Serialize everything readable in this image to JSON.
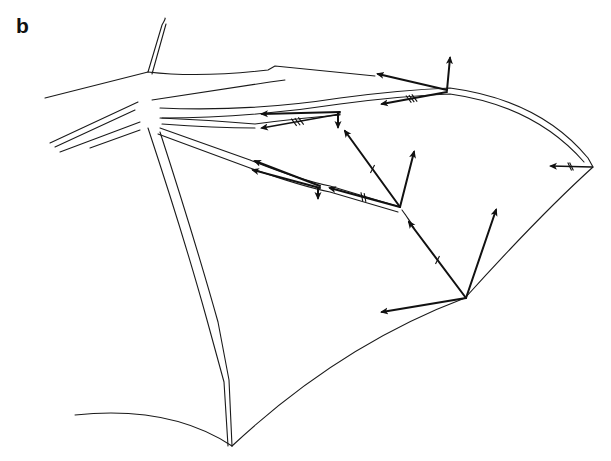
{
  "panel": {
    "label": "b"
  },
  "diagram": {
    "colors": {
      "line": "#1a1a1a",
      "background": "#ffffff"
    },
    "membrane_edges": [
      {
        "id": "trailing-edge-proximal",
        "d": "M 75 415 Q 170 405 232 446"
      },
      {
        "id": "trailing-edge-mid",
        "d": "M 232 446 Q 340 345 465 298"
      },
      {
        "id": "trailing-edge-distal",
        "d": "M 465 298 Q 540 215 593 167"
      },
      {
        "id": "propatagium-edge",
        "d": "M 45 98 L 148 72"
      },
      {
        "id": "inner-membrane-line",
        "d": "M 50 143 L 138 102"
      }
    ],
    "bones": [
      {
        "id": "forearm-upper",
        "d": "M 148 72 Q 200 78 268 70 L 275 66 L 375 76"
      },
      {
        "id": "forearm-lower",
        "d": "M 152 100 Q 205 92 270 82 L 285 80"
      },
      {
        "id": "thumb",
        "d": "M 148 72 L 162 25 Q 166 18 165 18"
      },
      {
        "id": "thumb-2",
        "d": "M 152 74 L 166 24"
      },
      {
        "id": "digit3-upper",
        "d": "M 160 108 Q 250 112 340 98 Q 400 90 450 88 Q 540 100 588 158 L 593 167"
      },
      {
        "id": "digit3-lower",
        "d": "M 162 118 Q 250 118 340 104 Q 400 96 450 94 Q 535 106 584 162"
      },
      {
        "id": "digit4-upper",
        "d": "M 160 118 Q 210 120 255 124 Q 300 118 340 115"
      },
      {
        "id": "digit4-lower",
        "d": "M 162 124 Q 215 128 255 128"
      },
      {
        "id": "digit5-upper",
        "d": "M 160 128 L 250 160 Q 300 180 330 186 L 400 207"
      },
      {
        "id": "digit5-lower",
        "d": "M 158 134 L 250 168 Q 300 186 330 192 L 398 212"
      },
      {
        "id": "digit5-distal",
        "d": "M 402 210 L 412 224 M 405 214 L 414 228"
      },
      {
        "id": "leg-outer",
        "d": "M 160 132 Q 195 240 218 322 L 229 380 L 232 446"
      },
      {
        "id": "leg-inner",
        "d": "M 148 128 Q 185 240 207 320 L 224 382 L 228 446"
      },
      {
        "id": "wrist-left",
        "d": "M 55 147 L 135 110 M 60 152 L 140 122"
      },
      {
        "id": "body-left",
        "d": "M 90 148 L 140 130"
      }
    ],
    "force_vectors": [
      {
        "id": "v1",
        "x1": 447,
        "y1": 90,
        "x2": 378,
        "y2": 74,
        "weight": "heavy"
      },
      {
        "id": "v2",
        "x1": 447,
        "y1": 90,
        "x2": 450,
        "y2": 58,
        "weight": "heavy"
      },
      {
        "id": "v3",
        "x1": 447,
        "y1": 92,
        "x2": 382,
        "y2": 104,
        "weight": "heavy",
        "ticks": 3
      },
      {
        "id": "v4",
        "x1": 340,
        "y1": 112,
        "x2": 262,
        "y2": 114,
        "weight": "heavy"
      },
      {
        "id": "v5",
        "x1": 340,
        "y1": 114,
        "x2": 262,
        "y2": 128,
        "weight": "thin",
        "ticks": 3
      },
      {
        "id": "v6",
        "x1": 338,
        "y1": 113,
        "x2": 338,
        "y2": 127,
        "weight": "heavy"
      },
      {
        "id": "v7",
        "x1": 400,
        "y1": 207,
        "x2": 345,
        "y2": 131,
        "weight": "heavy",
        "ticks": 1
      },
      {
        "id": "v8",
        "x1": 400,
        "y1": 207,
        "x2": 414,
        "y2": 152,
        "weight": "heavy"
      },
      {
        "id": "v9",
        "x1": 400,
        "y1": 207,
        "x2": 330,
        "y2": 188,
        "weight": "heavy",
        "ticks": 2
      },
      {
        "id": "v10",
        "x1": 320,
        "y1": 186,
        "x2": 255,
        "y2": 161,
        "weight": "heavy"
      },
      {
        "id": "v11",
        "x1": 320,
        "y1": 188,
        "x2": 253,
        "y2": 170,
        "weight": "heavy"
      },
      {
        "id": "v12",
        "x1": 318,
        "y1": 188,
        "x2": 318,
        "y2": 198,
        "weight": "heavy"
      },
      {
        "id": "v13",
        "x1": 466,
        "y1": 298,
        "x2": 409,
        "y2": 222,
        "weight": "heavy",
        "ticks": 1
      },
      {
        "id": "v14",
        "x1": 466,
        "y1": 298,
        "x2": 496,
        "y2": 210,
        "weight": "heavy"
      },
      {
        "id": "v15",
        "x1": 466,
        "y1": 298,
        "x2": 382,
        "y2": 312,
        "weight": "heavy"
      },
      {
        "id": "v16",
        "x1": 592,
        "y1": 167,
        "x2": 551,
        "y2": 166,
        "weight": "thin",
        "ticks": 2
      }
    ]
  }
}
